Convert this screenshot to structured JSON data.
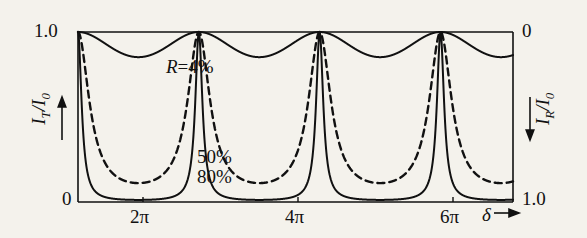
{
  "chart_data": {
    "type": "line",
    "title": "",
    "subtitle": "",
    "xlabel": "delta",
    "xlabel_display": "δ",
    "ylabel_left": "I_T/I_0",
    "ylabel_right": "I_R/I_0",
    "xlim": [
      0,
      7.2
    ],
    "xlim_units": "pi",
    "ylim_left": [
      0,
      1.0
    ],
    "ylim_right": [
      1.0,
      0
    ],
    "grid": false,
    "legend_position": "inline-annotations",
    "x_ticks": [
      {
        "value": 2,
        "label": "2π"
      },
      {
        "value": 4,
        "label": "4π"
      },
      {
        "value": 6,
        "label": "6π"
      }
    ],
    "y_ticks_left": [
      {
        "value": 0,
        "label": "0"
      },
      {
        "value": 1.0,
        "label": "1.0"
      }
    ],
    "y_ticks_right": [
      {
        "value": 0,
        "label": "0"
      },
      {
        "value": 1.0,
        "label": "1.0"
      }
    ],
    "series": [
      {
        "name": "R=4%",
        "label": "R=4%",
        "reflectance": 0.04,
        "style": "solid",
        "min_value": 0.926,
        "max_value": 1.0,
        "color": "#111111"
      },
      {
        "name": "50%",
        "label": "50%",
        "reflectance": 0.5,
        "style": "dashed",
        "min_value": 0.111,
        "max_value": 1.0,
        "color": "#111111"
      },
      {
        "name": "80%",
        "label": "80%",
        "reflectance": 0.8,
        "style": "solid",
        "min_value": 0.0123,
        "max_value": 1.0,
        "color": "#111111"
      }
    ],
    "annotations": [
      {
        "text": "R=4%",
        "x_pi": 1.05,
        "y": 0.8
      },
      {
        "text": "50%",
        "x_pi": 2.95,
        "y": 0.24
      },
      {
        "text": "80%",
        "x_pi": 2.95,
        "y": 0.12
      }
    ],
    "axis_arrows": {
      "left_axis": "up",
      "right_axis": "down",
      "x_axis": "right"
    }
  },
  "labels": {
    "y_left_top": "1.0",
    "y_left_bottom": "0",
    "y_right_top": "0",
    "y_right_bottom": "1.0",
    "x_tick_1": "2π",
    "x_tick_2": "4π",
    "x_tick_3": "6π",
    "x_axis_symbol": "δ",
    "annot_r4": "R=4%",
    "annot_50": "50%",
    "annot_80": "80%"
  }
}
